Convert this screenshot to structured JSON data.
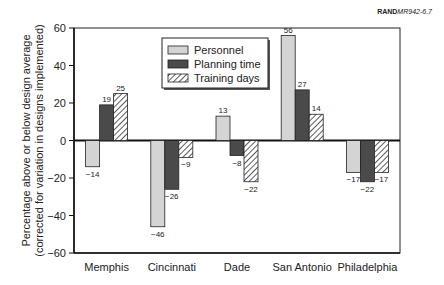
{
  "figure_code": {
    "bold": "RAND",
    "italic": "MR942-6.7"
  },
  "chart_data": {
    "type": "bar",
    "title": "",
    "xlabel": "",
    "ylabel": "Percentage above or below design average (corrected for variation in designs implemented)",
    "ylabel_lines": [
      "Percentage above or below design average",
      "(corrected for variation in designs implemented)"
    ],
    "ylim": [
      -60,
      60
    ],
    "yticks": [
      -60,
      -40,
      -20,
      0,
      20,
      40,
      60
    ],
    "ytick_labels": [
      "−60",
      "−40",
      "−20",
      "0",
      "20",
      "40",
      "60"
    ],
    "grid": false,
    "legend_position": "upper center",
    "categories": [
      "Memphis",
      "Cincinnati",
      "Dade",
      "San Antonio",
      "Philadelphia"
    ],
    "series": [
      {
        "name": "Personnel",
        "values": [
          -14,
          -46,
          13,
          56,
          -17
        ],
        "style": "light-gray",
        "color": "#d4d4d4"
      },
      {
        "name": "Planning time",
        "values": [
          19,
          -26,
          -8,
          27,
          -22
        ],
        "style": "dark-gray",
        "color": "#4a4a4a"
      },
      {
        "name": "Training days",
        "values": [
          25,
          -9,
          -22,
          14,
          -17
        ],
        "style": "hatched",
        "color": "#ffffff"
      }
    ]
  }
}
